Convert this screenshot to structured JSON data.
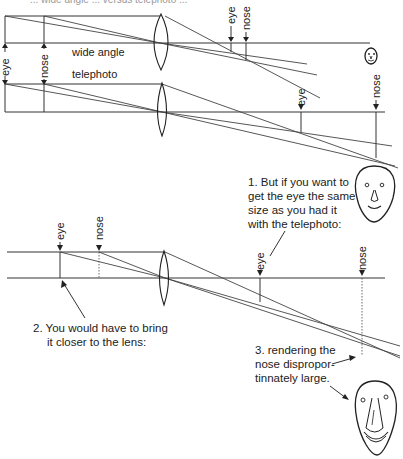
{
  "top_caption_cut": "... wide angle ... versus telephoto ...",
  "upper": {
    "object_labels": {
      "eye": "eye",
      "nose": "nose"
    },
    "row_labels": {
      "wide": "wide angle",
      "tele": "telephoto"
    },
    "wide_image_labels": {
      "eye": "eye",
      "nose": "nose"
    },
    "tele_image_labels": {
      "eye": "eye",
      "nose": "nose"
    }
  },
  "lower": {
    "object_labels": {
      "eye": "eye",
      "nose": "nose"
    },
    "image_labels": {
      "eye": "eye",
      "nose": "nose"
    }
  },
  "notes": {
    "n1": [
      "1.  But if you want to",
      "get the eye the same",
      "size as you had it",
      "with the telephoto:"
    ],
    "n2": [
      "2.  You would have to bring",
      "it closer to the lens:"
    ],
    "n3": [
      "3.  rendering the",
      "nose dispropor-",
      "tinnately large."
    ]
  }
}
